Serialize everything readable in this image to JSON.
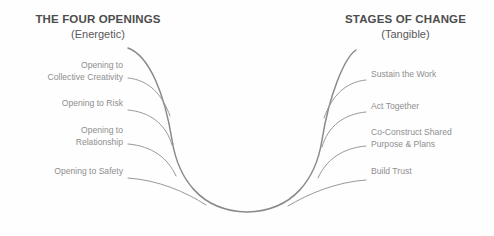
{
  "diagram": {
    "type": "u-process-curve",
    "background_color": "#fefefe",
    "curve_color": "#8a8a8a",
    "heading_color": "#4d4d4d",
    "label_color": "#8e8e8e",
    "left_column": {
      "title": "THE FOUR OPENINGS",
      "subtitle": "(Energetic)",
      "items": [
        {
          "label": "Opening to\nCollective Creativity"
        },
        {
          "label": "Opening to Risk"
        },
        {
          "label": "Opening to\nRelationship"
        },
        {
          "label": "Opening to Safety"
        }
      ]
    },
    "right_column": {
      "title": "STAGES OF CHANGE",
      "subtitle": "(Tangible)",
      "items": [
        {
          "label": "Sustain the Work"
        },
        {
          "label": "Act Together"
        },
        {
          "label": "Co-Construct Shared\nPurpose & Plans"
        },
        {
          "label": "Build Trust"
        }
      ]
    }
  }
}
